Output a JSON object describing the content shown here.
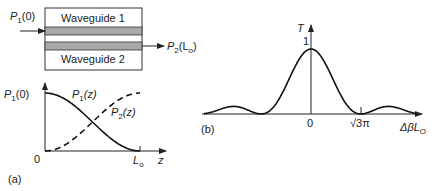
{
  "panel_a": {
    "caption": "(a)",
    "waveguide_top_label": "Waveguide 1",
    "waveguide_bottom_label": "Waveguide 2",
    "input_label": {
      "main": "P",
      "sub": "1",
      "arg": "(0)"
    },
    "output_label": {
      "main": "P",
      "sub": "2",
      "arg": "(L",
      "argsub": "o",
      "close": ")"
    },
    "core_color": "#a9a9a9",
    "plot": {
      "y_start_label": {
        "main": "P",
        "sub": "1",
        "arg": "(0)"
      },
      "origin_label": "0",
      "x_end_label": {
        "main": "L",
        "sub": "o"
      },
      "x_axis_label": "z",
      "curve1_label": {
        "main": "P",
        "sub": "1",
        "arg": "(z)"
      },
      "curve2_label": {
        "main": "P",
        "sub": "2",
        "arg": "(z)"
      }
    }
  },
  "panel_b": {
    "caption": "(b)",
    "y_axis_label": "T",
    "y_tick_label": "1",
    "x_tick_zero": "0",
    "x_tick_sqrt": "√3π",
    "x_axis_label": {
      "main": "Δβ",
      "l": "L",
      "sub": "O"
    }
  },
  "chart_data": [
    {
      "type": "line",
      "title": "",
      "xlabel": "z",
      "ylabel": "",
      "xlim": [
        0,
        1
      ],
      "ylim": [
        0,
        1
      ],
      "x_ticks": [
        "0",
        "Lo"
      ],
      "y_ticks": [
        "P1(0)"
      ],
      "series": [
        {
          "name": "P1(z)",
          "style": "solid",
          "x": [
            0,
            0.1,
            0.2,
            0.3,
            0.4,
            0.5,
            0.6,
            0.7,
            0.8,
            0.9,
            1.0
          ],
          "values": [
            1.0,
            0.976,
            0.905,
            0.794,
            0.655,
            0.5,
            0.345,
            0.206,
            0.095,
            0.024,
            0.0
          ]
        },
        {
          "name": "P2(z)",
          "style": "dashed",
          "x": [
            0,
            0.1,
            0.2,
            0.3,
            0.4,
            0.5,
            0.6,
            0.7,
            0.8,
            0.9,
            1.0
          ],
          "values": [
            0.0,
            0.024,
            0.095,
            0.206,
            0.345,
            0.5,
            0.655,
            0.794,
            0.905,
            0.976,
            1.0
          ]
        }
      ]
    },
    {
      "type": "line",
      "title": "",
      "xlabel": "ΔβLO",
      "ylabel": "T",
      "xlim": [
        -10.5,
        11.5
      ],
      "ylim": [
        0,
        1
      ],
      "x_ticks": [
        "0",
        "√3π"
      ],
      "y_ticks": [
        "1"
      ],
      "series": [
        {
          "name": "T",
          "style": "solid",
          "function": "sinc-like coupling transfer, peak 1 at 0, zeros at ±√3π, side lobes ~0.13"
        }
      ]
    }
  ]
}
